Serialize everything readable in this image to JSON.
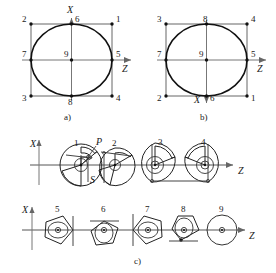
{
  "figure": {
    "type": "technical-diagram",
    "background_color": "#ffffff",
    "line_color": "#1a1a1a",
    "axis_color": "#777777"
  },
  "panel_a": {
    "caption": "a)",
    "axis_x_label": "X",
    "axis_z_label": "Z",
    "x_axis_direction": "up",
    "z_axis_direction": "right",
    "shape": "circle inscribed in square",
    "point_labels": {
      "top_left": "2",
      "top_center": "6",
      "top_right": "1",
      "mid_left": "7",
      "center": "9",
      "mid_right": "5",
      "bottom_left": "3",
      "bottom_center": "8",
      "bottom_right": "4"
    },
    "points_order": [
      "1",
      "2",
      "3",
      "4",
      "5",
      "6",
      "7",
      "8",
      "9"
    ]
  },
  "panel_b": {
    "caption": "b)",
    "axis_x_label": "X",
    "axis_z_label": "Z",
    "x_axis_direction": "down",
    "z_axis_direction": "right",
    "shape": "circle inscribed in square",
    "point_labels": {
      "top_left": "3",
      "top_center": "8",
      "top_right": "4",
      "mid_left": "7",
      "center": "9",
      "mid_right": "5",
      "bottom_left": "2",
      "bottom_center": "6",
      "bottom_right": "1"
    },
    "points_order": [
      "1",
      "2",
      "3",
      "4",
      "5",
      "6",
      "7",
      "8",
      "9"
    ]
  },
  "panel_c": {
    "caption": "c)",
    "axis_x_label": "X",
    "axis_z_label": "Z",
    "row_top": {
      "axis_x_label": "X",
      "axis_z_label": "Z",
      "items": [
        {
          "number": "1",
          "annotation_p": "P",
          "annotation_s": "S",
          "orientation": "spiral-with-callouts"
        },
        {
          "number": "2",
          "orientation": "spiral-right"
        },
        {
          "number": "3",
          "orientation": "spiral-left-tangent"
        },
        {
          "number": "4",
          "orientation": "spiral-right-tangent"
        }
      ]
    },
    "row_bottom": {
      "axis_x_label": "X",
      "axis_z_label": "Z",
      "items": [
        {
          "number": "5",
          "orientation": "point-right-vertical-tangent"
        },
        {
          "number": "6",
          "orientation": "point-down-horizontal-tangent"
        },
        {
          "number": "7",
          "orientation": "point-left-vertical-tangent"
        },
        {
          "number": "8",
          "orientation": "point-up-horizontal-tangent"
        },
        {
          "number": "9",
          "orientation": "plain-circle"
        }
      ]
    }
  }
}
